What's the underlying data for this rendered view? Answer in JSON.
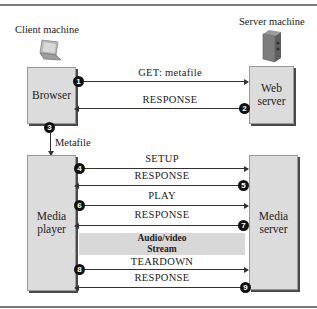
{
  "labels": {
    "client_machine": "Client machine",
    "server_machine": "Server machine",
    "metafile": "Metafile"
  },
  "boxes": {
    "browser": "Browser",
    "web_server_line1": "Web",
    "web_server_line2": "server",
    "media_player_line1": "Media",
    "media_player_line2": "player",
    "media_server_line1": "Media",
    "media_server_line2": "server"
  },
  "messages": [
    {
      "step": "1",
      "label": "GET: metafile",
      "direction": "right"
    },
    {
      "step": "2",
      "label": "RESPONSE",
      "direction": "left"
    },
    {
      "step": "3",
      "label": "Metafile",
      "direction": "down"
    },
    {
      "step": "4",
      "label": "SETUP",
      "direction": "right"
    },
    {
      "step": "5",
      "label": "RESPONSE",
      "direction": "left"
    },
    {
      "step": "6",
      "label": "PLAY",
      "direction": "right"
    },
    {
      "step": "7",
      "label": "RESPONSE",
      "direction": "left"
    },
    {
      "step": "8",
      "label": "TEARDOWN",
      "direction": "right"
    },
    {
      "step": "9",
      "label": "RESPONSE",
      "direction": "left"
    }
  ],
  "stream": {
    "line1": "Audio/video",
    "line2": "Stream"
  },
  "icons": {
    "client": "laptop-icon",
    "server": "server-tower-icon"
  }
}
